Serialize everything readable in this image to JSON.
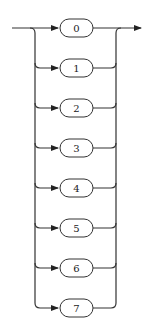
{
  "diagram": {
    "type": "railroad-choice",
    "choices": [
      {
        "label": "0"
      },
      {
        "label": "1"
      },
      {
        "label": "2"
      },
      {
        "label": "3"
      },
      {
        "label": "4"
      },
      {
        "label": "5"
      },
      {
        "label": "6"
      },
      {
        "label": "7"
      }
    ],
    "colors": {
      "line": "#333333",
      "box_fill": "#ffffff"
    }
  }
}
